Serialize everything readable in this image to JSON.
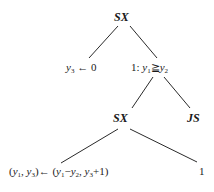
{
  "tree": {
    "root": {
      "label": "SX"
    },
    "left_leaf": {
      "var": "y",
      "sub": "3",
      "arrow": "←",
      "value": "0"
    },
    "right_cond": {
      "prefix": "1: ",
      "var1": "y",
      "sub1": "1",
      "op": "≧",
      "var2": "y",
      "sub2": "2"
    },
    "inner_sx": {
      "label": "SX"
    },
    "js": {
      "label": "JS"
    },
    "assign": {
      "lhs_open": "(",
      "lhs_v1": "y",
      "lhs_s1": "1",
      "lhs_comma": ", ",
      "lhs_v2": "y",
      "lhs_s2": "3",
      "lhs_close": ")",
      "arrow": "←",
      "rhs_open": " (",
      "rhs_v1": "y",
      "rhs_s1": "1",
      "rhs_minus": "−",
      "rhs_v2": "y",
      "rhs_s2": "2",
      "rhs_comma": ", ",
      "rhs_v3": "y",
      "rhs_s3": "3",
      "rhs_plus": "+1)"
    },
    "right_leaf": {
      "label": "1"
    }
  }
}
